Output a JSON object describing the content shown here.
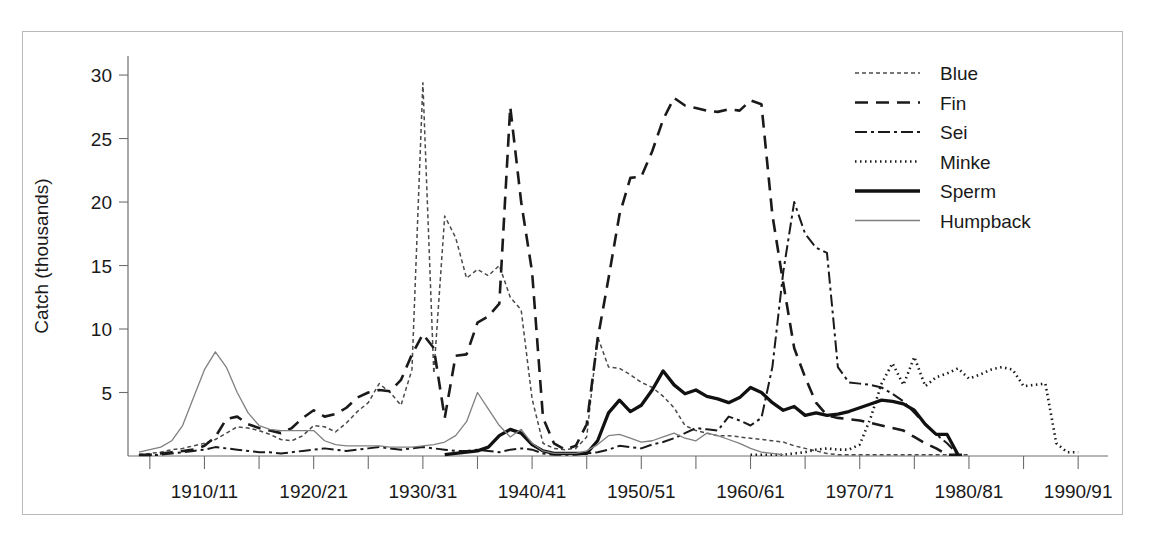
{
  "figure": {
    "frame_color": "#b9b9b9",
    "background": "#ffffff"
  },
  "chart_data": {
    "type": "line",
    "title": "",
    "subtitle": "",
    "xlabel": "",
    "ylabel": "Catch (thousands)",
    "xlim": [
      1903,
      1992
    ],
    "ylim": [
      0,
      31.5
    ],
    "yticks": [
      5,
      10,
      15,
      20,
      25,
      30
    ],
    "ytick_labels": [
      "5",
      "10",
      "15",
      "20",
      "25",
      "30"
    ],
    "xticks": [
      1905,
      1910,
      1915,
      1920,
      1925,
      1930,
      1935,
      1940,
      1945,
      1950,
      1955,
      1960,
      1965,
      1970,
      1975,
      1980,
      1985,
      1990
    ],
    "xtick_labels_major": [
      {
        "x": 1910,
        "label": "1910/11"
      },
      {
        "x": 1920,
        "label": "1920/21"
      },
      {
        "x": 1930,
        "label": "1930/31"
      },
      {
        "x": 1940,
        "label": "1940/41"
      },
      {
        "x": 1950,
        "label": "1950/51"
      },
      {
        "x": 1960,
        "label": "1960/61"
      },
      {
        "x": 1970,
        "label": "1970/71"
      },
      {
        "x": 1980,
        "label": "1980/81"
      },
      {
        "x": 1990,
        "label": "1990/91"
      }
    ],
    "grid": false,
    "legend_position": "top-right",
    "series": [
      {
        "name": "Blue",
        "style": "fine-dash",
        "color": "#4a4a4a",
        "width": 1.5,
        "dash": "4,3",
        "x": [
          1904,
          1905,
          1906,
          1907,
          1908,
          1909,
          1910,
          1911,
          1912,
          1913,
          1914,
          1915,
          1916,
          1917,
          1918,
          1919,
          1920,
          1921,
          1922,
          1923,
          1924,
          1925,
          1926,
          1927,
          1928,
          1929,
          1930,
          1931,
          1932,
          1933,
          1934,
          1935,
          1936,
          1937,
          1938,
          1939,
          1940,
          1941,
          1942,
          1943,
          1944,
          1945,
          1946,
          1947,
          1948,
          1949,
          1950,
          1951,
          1952,
          1953,
          1954,
          1955,
          1956,
          1957,
          1958,
          1959,
          1960,
          1961,
          1962,
          1963,
          1964,
          1965,
          1966,
          1967,
          1968,
          1969,
          1970,
          1971,
          1972,
          1973,
          1974,
          1975,
          1976,
          1977,
          1978,
          1979,
          1980
        ],
        "values": [
          0.1,
          0.2,
          0.3,
          0.5,
          0.6,
          0.8,
          1.0,
          1.3,
          1.8,
          2.3,
          2.2,
          2.0,
          1.7,
          1.3,
          1.2,
          1.6,
          2.4,
          2.3,
          1.9,
          2.6,
          3.5,
          4.2,
          5.7,
          5.0,
          4.0,
          6.8,
          29.4,
          6.5,
          18.9,
          17.2,
          14.0,
          14.7,
          14.2,
          15.0,
          12.5,
          11.5,
          4.5,
          1.0,
          0.6,
          0.5,
          0.6,
          1.5,
          9.4,
          7.0,
          6.9,
          6.4,
          5.8,
          5.4,
          4.7,
          3.8,
          2.4,
          2.0,
          1.8,
          1.6,
          1.6,
          1.5,
          1.4,
          1.3,
          1.2,
          1.1,
          0.8,
          0.6,
          0.4,
          0.2,
          0.1,
          0.1,
          0.1,
          0.1,
          0.1,
          0.1,
          0.1,
          0.1,
          0.1,
          0.1,
          0.1,
          0.1,
          0.1
        ]
      },
      {
        "name": "Fin",
        "style": "long-dash",
        "color": "#1a1a1a",
        "width": 2.6,
        "dash": "13,8",
        "x": [
          1904,
          1905,
          1906,
          1907,
          1908,
          1909,
          1910,
          1911,
          1912,
          1913,
          1914,
          1915,
          1916,
          1917,
          1918,
          1919,
          1920,
          1921,
          1922,
          1923,
          1924,
          1925,
          1926,
          1927,
          1928,
          1929,
          1930,
          1931,
          1932,
          1933,
          1934,
          1935,
          1936,
          1937,
          1938,
          1939,
          1940,
          1941,
          1942,
          1943,
          1944,
          1945,
          1946,
          1947,
          1948,
          1949,
          1950,
          1951,
          1952,
          1953,
          1954,
          1955,
          1956,
          1957,
          1958,
          1959,
          1960,
          1961,
          1962,
          1963,
          1964,
          1965,
          1966,
          1967,
          1968,
          1969,
          1970,
          1971,
          1972,
          1973,
          1974,
          1975,
          1976,
          1977,
          1978,
          1979,
          1980
        ],
        "values": [
          0.1,
          0.1,
          0.2,
          0.3,
          0.4,
          0.5,
          0.8,
          1.5,
          2.9,
          3.1,
          2.5,
          2.2,
          2.0,
          1.8,
          2.2,
          3.0,
          3.6,
          3.1,
          3.3,
          3.8,
          4.6,
          5.0,
          5.2,
          5.1,
          6.0,
          8.0,
          9.6,
          8.5,
          3.0,
          7.9,
          8.0,
          10.5,
          11.0,
          12.0,
          27.5,
          20.0,
          14.5,
          3.0,
          1.0,
          0.5,
          0.8,
          2.5,
          9.2,
          14.0,
          19.0,
          21.9,
          22.0,
          24.0,
          26.5,
          28.2,
          27.6,
          27.4,
          27.2,
          27.1,
          27.3,
          27.2,
          28.0,
          27.7,
          19.0,
          13.6,
          8.5,
          6.2,
          4.2,
          3.2,
          3.0,
          2.9,
          2.8,
          2.6,
          2.4,
          2.2,
          2.0,
          1.5,
          1.0,
          0.6,
          0.1,
          0.1,
          0.1
        ]
      },
      {
        "name": "Sei",
        "style": "dash-dot",
        "color": "#1a1a1a",
        "width": 2.0,
        "dash": "12,4,3,4",
        "x": [
          1904,
          1905,
          1906,
          1907,
          1908,
          1909,
          1910,
          1911,
          1912,
          1913,
          1914,
          1915,
          1916,
          1917,
          1918,
          1919,
          1920,
          1921,
          1922,
          1923,
          1924,
          1925,
          1926,
          1927,
          1928,
          1929,
          1930,
          1931,
          1932,
          1933,
          1934,
          1935,
          1936,
          1937,
          1938,
          1939,
          1940,
          1941,
          1942,
          1943,
          1944,
          1945,
          1946,
          1947,
          1948,
          1949,
          1950,
          1951,
          1952,
          1953,
          1954,
          1955,
          1956,
          1957,
          1958,
          1959,
          1960,
          1961,
          1962,
          1963,
          1964,
          1965,
          1966,
          1967,
          1968,
          1969,
          1970,
          1971,
          1972,
          1973,
          1974,
          1975,
          1976,
          1977,
          1978,
          1979
        ],
        "values": [
          0.05,
          0.05,
          0.1,
          0.2,
          0.3,
          0.4,
          0.5,
          0.7,
          0.6,
          0.5,
          0.4,
          0.3,
          0.3,
          0.2,
          0.3,
          0.4,
          0.5,
          0.6,
          0.5,
          0.4,
          0.5,
          0.6,
          0.7,
          0.6,
          0.5,
          0.6,
          0.7,
          0.6,
          0.5,
          0.4,
          0.4,
          0.5,
          0.4,
          0.3,
          0.5,
          0.6,
          0.5,
          0.2,
          0.1,
          0.1,
          0.1,
          0.2,
          0.3,
          0.5,
          0.8,
          0.7,
          0.6,
          0.9,
          1.1,
          1.4,
          1.8,
          2.2,
          2.1,
          2.0,
          3.1,
          2.8,
          2.4,
          3.0,
          7.0,
          14.5,
          20.0,
          17.5,
          16.4,
          16.0,
          7.0,
          5.8,
          5.7,
          5.6,
          5.4,
          4.9,
          4.3,
          3.4,
          2.5,
          1.7,
          1.0,
          0.1
        ]
      },
      {
        "name": "Minke",
        "style": "dotted",
        "color": "#1a1a1a",
        "width": 2.6,
        "dash": "1.5,3.5",
        "x": [
          1960,
          1961,
          1962,
          1963,
          1964,
          1965,
          1966,
          1967,
          1968,
          1969,
          1970,
          1971,
          1972,
          1973,
          1974,
          1975,
          1976,
          1977,
          1978,
          1979,
          1980,
          1981,
          1982,
          1983,
          1984,
          1985,
          1986,
          1987,
          1988,
          1989,
          1990
        ],
        "values": [
          0.1,
          0.1,
          0.1,
          0.1,
          0.2,
          0.3,
          0.5,
          0.6,
          0.5,
          0.5,
          0.9,
          3.0,
          5.7,
          7.3,
          5.6,
          7.8,
          5.5,
          6.2,
          6.5,
          6.9,
          6.1,
          6.4,
          6.8,
          7.0,
          6.8,
          5.5,
          5.6,
          5.7,
          1.0,
          0.3,
          0.3
        ]
      },
      {
        "name": "Sperm",
        "style": "thick-solid",
        "color": "#111111",
        "width": 3.3,
        "dash": "",
        "x": [
          1932,
          1933,
          1934,
          1935,
          1936,
          1937,
          1938,
          1939,
          1940,
          1941,
          1942,
          1943,
          1944,
          1945,
          1946,
          1947,
          1948,
          1949,
          1950,
          1951,
          1952,
          1953,
          1954,
          1955,
          1956,
          1957,
          1958,
          1959,
          1960,
          1961,
          1962,
          1963,
          1964,
          1965,
          1966,
          1967,
          1968,
          1969,
          1970,
          1971,
          1972,
          1973,
          1974,
          1975,
          1976,
          1977,
          1978,
          1979
        ],
        "values": [
          0.1,
          0.2,
          0.3,
          0.4,
          0.7,
          1.6,
          2.1,
          1.8,
          0.9,
          0.4,
          0.2,
          0.2,
          0.2,
          0.2,
          1.2,
          3.4,
          4.4,
          3.5,
          4.0,
          5.2,
          6.7,
          5.6,
          4.9,
          5.2,
          4.7,
          4.5,
          4.2,
          4.6,
          5.4,
          5.0,
          4.2,
          3.6,
          3.9,
          3.2,
          3.4,
          3.2,
          3.3,
          3.5,
          3.8,
          4.1,
          4.4,
          4.3,
          4.1,
          3.6,
          2.5,
          1.7,
          1.7,
          0.1
        ]
      },
      {
        "name": "Humpback",
        "style": "thin-solid",
        "color": "#808080",
        "width": 1.3,
        "dash": "",
        "x": [
          1904,
          1905,
          1906,
          1907,
          1908,
          1909,
          1910,
          1911,
          1912,
          1913,
          1914,
          1915,
          1916,
          1917,
          1918,
          1919,
          1920,
          1921,
          1922,
          1923,
          1924,
          1925,
          1926,
          1927,
          1928,
          1929,
          1930,
          1931,
          1932,
          1933,
          1934,
          1935,
          1936,
          1937,
          1938,
          1939,
          1940,
          1941,
          1942,
          1943,
          1944,
          1945,
          1946,
          1947,
          1948,
          1949,
          1950,
          1951,
          1952,
          1953,
          1954,
          1955,
          1956,
          1957,
          1958,
          1959,
          1960,
          1961,
          1962,
          1963
        ],
        "values": [
          0.3,
          0.5,
          0.7,
          1.2,
          2.4,
          4.6,
          6.8,
          8.2,
          7.0,
          5.0,
          3.4,
          2.4,
          2.1,
          2.0,
          2.0,
          2.0,
          2.0,
          1.2,
          0.9,
          0.8,
          0.8,
          0.8,
          0.8,
          0.7,
          0.7,
          0.7,
          0.8,
          0.9,
          1.1,
          1.6,
          2.7,
          5.0,
          3.7,
          2.4,
          1.5,
          2.1,
          1.0,
          0.4,
          0.2,
          0.2,
          0.2,
          0.4,
          0.9,
          1.6,
          1.7,
          1.4,
          1.1,
          1.2,
          1.5,
          1.8,
          1.4,
          1.2,
          1.8,
          1.6,
          1.3,
          1.0,
          0.6,
          0.3,
          0.2,
          0.1
        ]
      }
    ]
  },
  "legend": {
    "items": [
      {
        "label": "Blue",
        "series": "Blue"
      },
      {
        "label": "Fin",
        "series": "Fin"
      },
      {
        "label": "Sei",
        "series": "Sei"
      },
      {
        "label": "Minke",
        "series": "Minke"
      },
      {
        "label": "Sperm",
        "series": "Sperm"
      },
      {
        "label": "Humpback",
        "series": "Humpback"
      }
    ]
  }
}
